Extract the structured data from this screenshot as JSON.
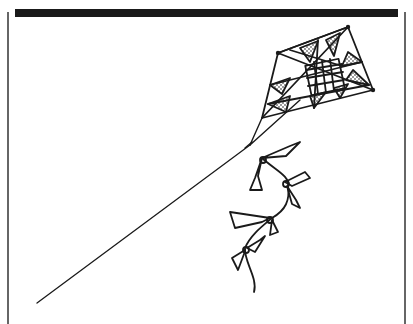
{
  "image": {
    "subject": "kite",
    "description": "Hand-drawn black ink line illustration of a patterned kite with a bow-tied tail and a long string, framed with a thick top bar and thin side borders",
    "colors": {
      "ink": "#1a1a1a",
      "background": "#ffffff"
    }
  }
}
